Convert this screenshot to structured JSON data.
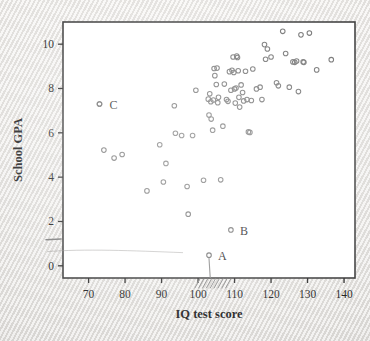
{
  "figure": {
    "background_color": "#eceae7",
    "plot_background_color": "#ffffff",
    "frame_color": "#3a3a3a",
    "marker_color": "#6e6e6e",
    "annotation_color": "#8a8a8a"
  },
  "chart_data": {
    "type": "scatter",
    "title": "",
    "xlabel": "IQ test score",
    "ylabel": "School GPA",
    "xlim": [
      63,
      143
    ],
    "ylim": [
      -0.55,
      11.0
    ],
    "xticks": [
      70,
      80,
      90,
      100,
      110,
      120,
      130,
      140
    ],
    "xtick_labels": [
      "70",
      "80",
      "90",
      "100",
      "110",
      "120",
      "130",
      "140"
    ],
    "yticks": [
      0,
      2,
      4,
      6,
      8,
      10
    ],
    "ytick_labels": [
      "0",
      "2",
      "4",
      "6",
      "8",
      "10"
    ],
    "grid": false,
    "legend": null,
    "marker": "open-circle",
    "points": [
      [
        73.0,
        7.3
      ],
      [
        74.2,
        5.22
      ],
      [
        77.0,
        4.86
      ],
      [
        79.2,
        5.02
      ],
      [
        86.0,
        3.38
      ],
      [
        89.5,
        5.46
      ],
      [
        90.5,
        3.78
      ],
      [
        91.2,
        4.62
      ],
      [
        93.5,
        7.22
      ],
      [
        93.8,
        5.98
      ],
      [
        95.5,
        5.88
      ],
      [
        97.0,
        3.58
      ],
      [
        97.3,
        2.33
      ],
      [
        98.5,
        5.88
      ],
      [
        99.4,
        7.92
      ],
      [
        101.5,
        3.86
      ],
      [
        102.8,
        7.52
      ],
      [
        103.0,
        6.8
      ],
      [
        103.2,
        7.76
      ],
      [
        103.5,
        7.4
      ],
      [
        103.6,
        6.62
      ],
      [
        104.0,
        6.12
      ],
      [
        104.2,
        7.48
      ],
      [
        104.4,
        8.9
      ],
      [
        104.6,
        8.58
      ],
      [
        105.0,
        8.18
      ],
      [
        105.2,
        8.92
      ],
      [
        105.4,
        7.36
      ],
      [
        105.6,
        7.6
      ],
      [
        106.2,
        3.88
      ],
      [
        106.8,
        6.3
      ],
      [
        107.2,
        8.2
      ],
      [
        107.8,
        7.5
      ],
      [
        108.2,
        7.42
      ],
      [
        108.6,
        8.76
      ],
      [
        109.0,
        7.92
      ],
      [
        109.3,
        8.82
      ],
      [
        109.6,
        9.42
      ],
      [
        109.8,
        8.72
      ],
      [
        110.0,
        7.98
      ],
      [
        110.2,
        7.34
      ],
      [
        110.4,
        8.02
      ],
      [
        110.6,
        9.46
      ],
      [
        110.8,
        9.4
      ],
      [
        111.0,
        8.8
      ],
      [
        111.2,
        7.6
      ],
      [
        111.4,
        7.16
      ],
      [
        111.8,
        8.16
      ],
      [
        112.2,
        7.82
      ],
      [
        112.5,
        7.44
      ],
      [
        113.0,
        8.78
      ],
      [
        113.4,
        7.5
      ],
      [
        113.8,
        6.04
      ],
      [
        114.2,
        6.02
      ],
      [
        114.6,
        7.46
      ],
      [
        115.0,
        8.88
      ],
      [
        116.0,
        7.98
      ],
      [
        117.0,
        8.06
      ],
      [
        117.5,
        7.5
      ],
      [
        118.2,
        9.98
      ],
      [
        118.5,
        9.32
      ],
      [
        119.0,
        9.78
      ],
      [
        120.0,
        9.42
      ],
      [
        121.5,
        8.26
      ],
      [
        122.0,
        8.12
      ],
      [
        123.2,
        10.58
      ],
      [
        124.0,
        9.58
      ],
      [
        125.0,
        8.06
      ],
      [
        126.0,
        9.2
      ],
      [
        126.5,
        9.18
      ],
      [
        127.0,
        9.24
      ],
      [
        127.5,
        7.86
      ],
      [
        128.2,
        10.42
      ],
      [
        128.8,
        9.2
      ],
      [
        129.0,
        9.18
      ],
      [
        130.5,
        10.5
      ],
      [
        132.5,
        8.84
      ],
      [
        136.5,
        9.3
      ]
    ],
    "labeled_points": [
      {
        "label": "A",
        "x": 103.0,
        "y": 0.48,
        "label_dx": 9,
        "label_dy": 1
      },
      {
        "label": "B",
        "x": 109.0,
        "y": 1.62,
        "label_dx": 9,
        "label_dy": 1
      },
      {
        "label": "C",
        "x": 73.0,
        "y": 7.3,
        "label_dx": 10,
        "label_dy": 1
      }
    ],
    "annotations": [
      {
        "kind": "drop-line",
        "from_x": 103.0,
        "from_y": 0.48,
        "to_y": -0.52
      },
      {
        "kind": "axis-hatching",
        "x_start": 100.5,
        "x_end": 110.0,
        "count": 9
      },
      {
        "kind": "margin-tick",
        "y": 1.18
      }
    ]
  }
}
